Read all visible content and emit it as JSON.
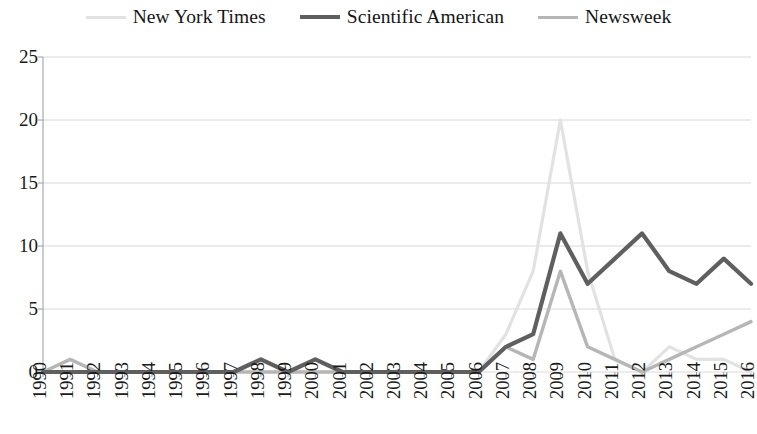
{
  "legend": {
    "position": "top-center",
    "items": [
      {
        "label": "New York Times",
        "color": "#e2e2e2",
        "width": 3.2,
        "icon": "line-swatch"
      },
      {
        "label": "Scientific American",
        "color": "#5f5f5f",
        "width": 4.2,
        "icon": "line-swatch"
      },
      {
        "label": "Newsweek",
        "color": "#b6b6b6",
        "width": 3.4,
        "icon": "line-swatch"
      }
    ]
  },
  "axes": {
    "y_ticks": [
      "0",
      "5",
      "10",
      "15",
      "20",
      "25"
    ],
    "x_ticks": [
      "1990",
      "1991",
      "1992",
      "1993",
      "1994",
      "1995",
      "1996",
      "1997",
      "1998",
      "1999",
      "2000",
      "2001",
      "2002",
      "2003",
      "2004",
      "2005",
      "2006",
      "2007",
      "2008",
      "2009",
      "2010",
      "2011",
      "2012",
      "2013",
      "2014",
      "2015",
      "2016"
    ]
  },
  "colors": {
    "gridline": "#d8d8d8",
    "axis": "#9a9a9a",
    "text": "#1a1a1a",
    "background": "#ffffff"
  },
  "chart_data": {
    "type": "line",
    "title": "",
    "xlabel": "",
    "ylabel": "",
    "ylim": [
      0,
      25
    ],
    "yticks": [
      0,
      5,
      10,
      15,
      20,
      25
    ],
    "grid": true,
    "legend_position": "top-center",
    "categories": [
      "1990",
      "1991",
      "1992",
      "1993",
      "1994",
      "1995",
      "1996",
      "1997",
      "1998",
      "1999",
      "2000",
      "2001",
      "2002",
      "2003",
      "2004",
      "2005",
      "2006",
      "2007",
      "2008",
      "2009",
      "2010",
      "2011",
      "2012",
      "2013",
      "2014",
      "2015",
      "2016"
    ],
    "series": [
      {
        "name": "New York Times",
        "color": "#e2e2e2",
        "values": [
          0,
          0,
          0,
          0,
          0,
          0,
          0,
          0,
          0,
          0,
          0,
          0,
          0,
          0,
          0,
          0,
          0,
          3,
          8,
          20,
          8,
          1,
          0,
          2,
          1,
          1,
          0
        ]
      },
      {
        "name": "Scientific American",
        "color": "#5f5f5f",
        "values": [
          0,
          0,
          0,
          0,
          0,
          0,
          0,
          0,
          1,
          0,
          1,
          0,
          0,
          0,
          0,
          0,
          0,
          2,
          3,
          11,
          7,
          9,
          11,
          8,
          7,
          9,
          7
        ]
      },
      {
        "name": "Newsweek",
        "color": "#b6b6b6",
        "values": [
          0,
          1,
          0,
          0,
          0,
          0,
          0,
          0,
          0,
          0,
          0,
          0,
          0,
          0,
          0,
          0,
          0,
          2,
          1,
          8,
          2,
          1,
          0,
          1,
          2,
          3,
          4
        ]
      }
    ]
  }
}
